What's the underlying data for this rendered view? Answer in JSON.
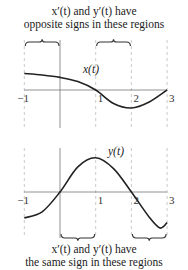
{
  "top_caption": {
    "line1": "x′(t) and y′(t) have",
    "line2": "opposite signs in these regions"
  },
  "bottom_caption": {
    "line1": "x′(t) and y′(t) have",
    "line2": "the same sign in these regions"
  },
  "chart_data": [
    {
      "type": "line",
      "title": "",
      "curve_label": "x(t)",
      "x_ticks": [
        "−1",
        "1",
        "2",
        "3"
      ],
      "x_range": [
        -1,
        3
      ],
      "y_range": [
        -1,
        1
      ],
      "series": [
        {
          "name": "x(t)",
          "x": [
            -1,
            -0.5,
            0,
            0.5,
            1,
            1.5,
            2,
            2.5,
            3
          ],
          "y": [
            0.55,
            0.5,
            0.42,
            0.28,
            0,
            -0.45,
            -0.6,
            -0.4,
            0
          ]
        }
      ],
      "dashed_guides_at": [
        -1,
        1,
        2,
        3
      ]
    },
    {
      "type": "line",
      "title": "",
      "curve_label": "y(t)",
      "x_ticks": [
        "−1",
        "1",
        "2",
        "3"
      ],
      "x_range": [
        -1,
        3
      ],
      "y_range": [
        -1,
        1
      ],
      "series": [
        {
          "name": "y(t)",
          "x": [
            -1,
            -0.5,
            0,
            0.5,
            1,
            1.5,
            2,
            2.5,
            2.8,
            3
          ],
          "y": [
            -0.72,
            -0.55,
            0,
            0.7,
            0.95,
            0.65,
            0,
            -0.7,
            -1.0,
            -0.85
          ]
        }
      ],
      "dashed_guides_at": [
        -1,
        0,
        1,
        2,
        3
      ]
    }
  ],
  "braces": {
    "top": [
      [
        -1,
        0
      ],
      [
        1,
        2
      ]
    ],
    "bottom": [
      [
        0,
        1
      ],
      [
        2,
        3
      ]
    ]
  }
}
